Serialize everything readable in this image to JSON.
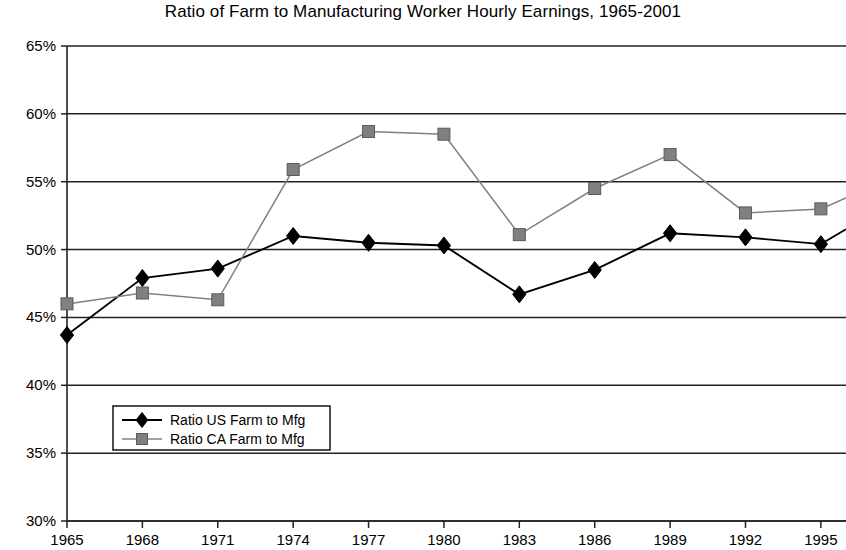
{
  "chart_data": {
    "type": "line",
    "title": "Ratio of Farm to Manufacturing Worker Hourly Earnings, 1965-2001",
    "xlabel": "",
    "ylabel": "",
    "x": [
      1965,
      1968,
      1971,
      1974,
      1977,
      1980,
      1983,
      1986,
      1989,
      1992,
      1995
    ],
    "categories": [
      "1965",
      "1968",
      "1971",
      "1974",
      "1977",
      "1980",
      "1983",
      "1986",
      "1989",
      "1992",
      "1995"
    ],
    "series": [
      {
        "name": "Ratio US Farm to Mfg",
        "values": [
          43.7,
          47.9,
          48.6,
          51.0,
          50.5,
          50.3,
          46.7,
          48.5,
          51.2,
          50.9,
          50.4
        ],
        "color": "#000000",
        "marker": "diamond",
        "trailing_value": 51.5
      },
      {
        "name": "Ratio CA Farm to Mfg",
        "values": [
          46.0,
          46.8,
          46.3,
          55.9,
          58.7,
          58.5,
          51.1,
          54.5,
          57.0,
          52.7,
          53.0
        ],
        "color": "#808080",
        "marker": "square",
        "trailing_value": 53.8
      }
    ],
    "ylim": [
      30,
      65
    ],
    "ytick_step": 5,
    "ytick_labels": [
      "65%",
      "60%",
      "55%",
      "50%",
      "45%",
      "40%",
      "35%",
      "30%"
    ],
    "ytick_values": [
      65,
      60,
      55,
      50,
      45,
      40,
      35,
      30
    ],
    "xlim": [
      1965,
      1996
    ],
    "grid": true,
    "grid_axis": "y",
    "legend_position": "inside-lower-left",
    "legend_entries": [
      "Ratio US Farm to Mfg",
      "Ratio CA Farm to Mfg"
    ]
  }
}
